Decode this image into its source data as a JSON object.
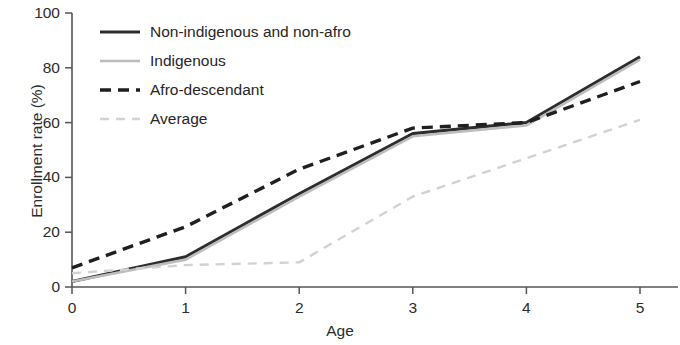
{
  "chart_data": {
    "type": "line",
    "title": "",
    "xlabel": "Age",
    "ylabel": "Enrollment rate (%)",
    "x": [
      0,
      1,
      2,
      3,
      4,
      5
    ],
    "categories": [
      "0",
      "1",
      "2",
      "3",
      "4",
      "5"
    ],
    "xlim": [
      0,
      5
    ],
    "ylim": [
      0,
      100
    ],
    "yticks": [
      0,
      20,
      40,
      60,
      80,
      100
    ],
    "ytick_labels": [
      "0",
      "20",
      "40",
      "60",
      "80",
      "100"
    ],
    "xticks": [
      0,
      1,
      2,
      3,
      4,
      5
    ],
    "xtick_labels": [
      "0",
      "1",
      "2",
      "3",
      "4",
      "5"
    ],
    "grid": false,
    "legend_position": "top-left",
    "series": [
      {
        "name": "Non-indigenous and non-afro",
        "values": [
          2,
          11,
          34,
          56,
          60,
          84
        ],
        "color": "#2d2d2d",
        "style": "solid",
        "width": 3.2
      },
      {
        "name": "Indigenous",
        "values": [
          2,
          10,
          33,
          55,
          59,
          83
        ],
        "color": "#bdbdbd",
        "style": "solid",
        "width": 2.6
      },
      {
        "name": "Afro-descendant",
        "values": [
          7,
          22,
          43,
          58,
          60,
          75
        ],
        "color": "#1f1f1f",
        "style": "dashed",
        "width": 3.4,
        "dash": "11,7"
      },
      {
        "name": "Average",
        "values": [
          5,
          8,
          9,
          33,
          47,
          61
        ],
        "color": "#d2d2d2",
        "style": "dashed",
        "width": 2.4,
        "dash": "9,7"
      }
    ]
  },
  "axes": {
    "color": "#555555",
    "x_origin_px": 72,
    "y_origin_px": 287,
    "x_max_px": 640,
    "y_max_px": 13
  },
  "legend": {
    "items": [
      {
        "label": "Non-indigenous and non-afro",
        "swatch": "solid-dark-line"
      },
      {
        "label": "Indigenous",
        "swatch": "solid-light-line"
      },
      {
        "label": "Afro-descendant",
        "swatch": "dashed-dark-line"
      },
      {
        "label": "Average",
        "swatch": "dashed-light-line"
      }
    ]
  }
}
